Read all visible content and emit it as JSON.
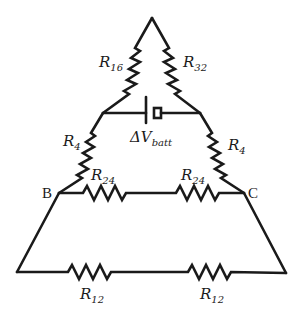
{
  "diagram": {
    "type": "circuit-schematic",
    "stroke_color": "#1a1a1a",
    "background": "#ffffff",
    "nodes": {
      "B": {
        "label": "B"
      },
      "C": {
        "label": "C"
      }
    },
    "battery": {
      "label_main": "ΔV",
      "label_sub": "batt"
    },
    "resistors": {
      "r16": {
        "main": "R",
        "sub": "16"
      },
      "r32": {
        "main": "R",
        "sub": "32"
      },
      "r4_left": {
        "main": "R",
        "sub": "4"
      },
      "r4_right": {
        "main": "R",
        "sub": "4"
      },
      "r24_left": {
        "main": "R",
        "sub": "24"
      },
      "r24_right": {
        "main": "R",
        "sub": "24"
      },
      "r12_left": {
        "main": "R",
        "sub": "12"
      },
      "r12_right": {
        "main": "R",
        "sub": "12"
      }
    }
  }
}
